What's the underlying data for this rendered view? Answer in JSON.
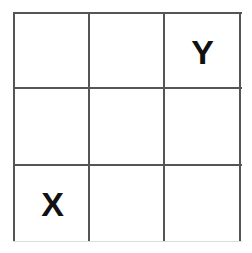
{
  "grid": {
    "rows": 3,
    "cols": 3,
    "cells": [
      [
        "",
        "",
        "Y"
      ],
      [
        "",
        "",
        ""
      ],
      [
        "X",
        "",
        ""
      ]
    ]
  },
  "labels": {
    "y": "Y",
    "x": "X"
  }
}
